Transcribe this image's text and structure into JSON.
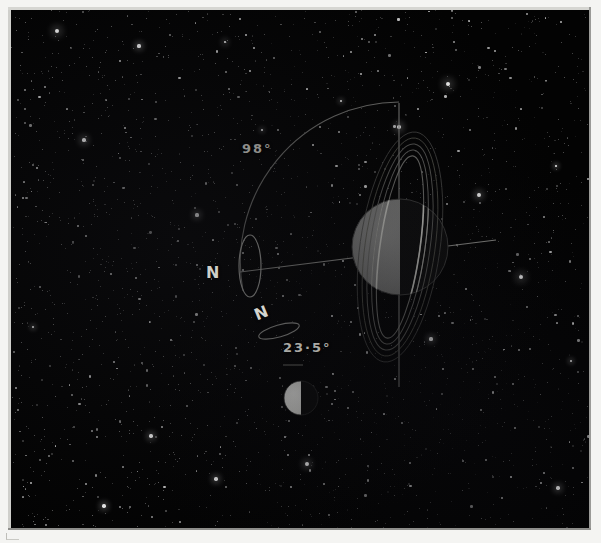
{
  "figure": {
    "background_color": "#030303",
    "line_color": "#9d9d98",
    "label_color": "#b9b9b4"
  },
  "labels": {
    "uranus_tilt": "98°",
    "earth_tilt": "23·5°",
    "uranus_north_pole": "N",
    "earth_north_pole": "N"
  },
  "bodies": {
    "uranus": {
      "name": "Uranus",
      "center_x": 400,
      "center_y": 247,
      "radius": 48,
      "lit_side": "left",
      "lit_color": "#7d7d7d",
      "dark_color": "#101010",
      "ring_count": 5,
      "ring_color": "#8e8e8a",
      "ring_tilt_deg": 8
    },
    "earth": {
      "name": "Earth",
      "center_x": 301,
      "center_y": 398,
      "radius": 17,
      "lit_side": "left",
      "lit_color": "#e8e8e4",
      "dark_color": "#0b0b0b"
    }
  },
  "geometry": {
    "orbital_normal_line": {
      "x": 399,
      "y_top": 103,
      "y_bottom": 387
    },
    "uranus_rotation_axis": {
      "x1": 240,
      "y1": 272,
      "x2": 496,
      "y2": 240
    },
    "uranus_equator_ellipse": {
      "cx": 250,
      "cy": 266,
      "rx": 11,
      "ry": 31
    },
    "earth_equator_ellipse": {
      "cx": 279,
      "cy": 331,
      "rx": 21,
      "ry": 6,
      "rotate_deg": -16
    },
    "tilt_arc_98": {
      "cx": 399,
      "cy": 262,
      "radius": 160,
      "start_deg": 270,
      "end_deg": 188
    }
  },
  "chart_data": {
    "type": "diagram",
    "annotations": [
      {
        "label": "98°",
        "subject": "Uranus",
        "meaning": "axial tilt from orbital plane normal"
      },
      {
        "label": "23·5°",
        "subject": "Earth",
        "meaning": "axial tilt from orbital plane normal"
      },
      {
        "label": "N",
        "subject": "Uranus",
        "meaning": "north rotational pole direction"
      },
      {
        "label": "N",
        "subject": "Earth",
        "meaning": "north rotational pole direction"
      }
    ],
    "series": [
      {
        "name": "Uranus",
        "tilt_degrees": 98
      },
      {
        "name": "Earth",
        "tilt_degrees": 23.5
      }
    ]
  }
}
